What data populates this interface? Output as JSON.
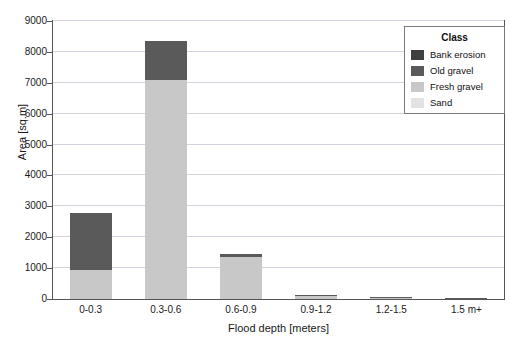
{
  "chart_data": {
    "type": "bar",
    "subtype": "stacked-bar",
    "title": "",
    "xlabel": "Flood depth [meters]",
    "ylabel": "Area [sq.m]",
    "categories": [
      "0-0.3",
      "0.3-0.6",
      "0.6-0.9",
      "0.9-1.2",
      "1.2-1.5",
      "1.5 m+"
    ],
    "series": [
      {
        "name": "Sand",
        "color": "#e3e3e3",
        "values": [
          0,
          0,
          0,
          0,
          0,
          0
        ]
      },
      {
        "name": "Fresh gravel",
        "color": "#c8c8c8",
        "values": [
          950,
          7100,
          1350,
          110,
          25,
          12
        ]
      },
      {
        "name": "Old gravel",
        "color": "#5a5a5a",
        "values": [
          1830,
          1250,
          120,
          20,
          8,
          4
        ]
      },
      {
        "name": "Bank erosion",
        "color": "#3f3f3f",
        "values": [
          0,
          0,
          0,
          0,
          0,
          0
        ]
      }
    ],
    "totals": [
      2780,
      8350,
      1470,
      130,
      33,
      16
    ],
    "ylim": [
      0,
      9000
    ],
    "yticks": [
      0,
      1000,
      2000,
      3000,
      4000,
      5000,
      6000,
      7000,
      8000,
      9000
    ],
    "ytick_labels": [
      "0",
      "1000",
      "2000",
      "3000",
      "4000",
      "5000",
      "6000",
      "7000",
      "8000",
      "9000"
    ],
    "grid": true,
    "grid_axis": "y",
    "legend_position": "top-right",
    "stack_order_bottom_to_top": [
      "Sand",
      "Fresh gravel",
      "Old gravel",
      "Bank erosion"
    ]
  },
  "legend": {
    "title": "Class",
    "items": [
      {
        "label": "Bank erosion",
        "color": "#3f3f3f"
      },
      {
        "label": "Old gravel",
        "color": "#5a5a5a"
      },
      {
        "label": "Fresh gravel",
        "color": "#c8c8c8"
      },
      {
        "label": "Sand",
        "color": "#e3e3e3"
      }
    ]
  },
  "colors": {
    "axis": "#555555",
    "grid": "#d4d4e0",
    "text": "#1a1a1a",
    "background": "#ffffff"
  }
}
